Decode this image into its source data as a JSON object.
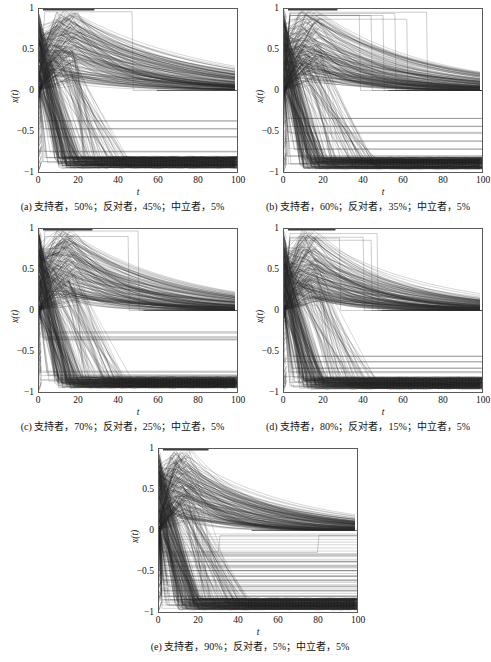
{
  "figure": {
    "background": "#ffffff",
    "line_color": "#2b2b2b",
    "frame_color": "#5a5a5a"
  },
  "axis": {
    "xlabel": "t",
    "ylabel": "x(t)",
    "xticks": [
      "0",
      "20",
      "40",
      "60",
      "80",
      "100"
    ],
    "xtick_values": [
      0,
      20,
      40,
      60,
      80,
      100
    ],
    "yticks": [
      "1",
      "0.5",
      "0",
      "−0.5",
      "−1"
    ],
    "ytick_values": [
      1,
      0.5,
      0,
      -0.5,
      -1
    ],
    "xlim": [
      0,
      100
    ],
    "ylim": [
      -1,
      1
    ],
    "grid": false
  },
  "panels": [
    {
      "id": "a",
      "caption": "(a) 支持者，50%；反对者，45%；中立者，5%",
      "supporters_pct": 50,
      "opponents_pct": 45,
      "neutral_pct": 5
    },
    {
      "id": "b",
      "caption": "(b) 支持者，60%；反对者，35%；中立者，5%",
      "supporters_pct": 60,
      "opponents_pct": 35,
      "neutral_pct": 5
    },
    {
      "id": "c",
      "caption": "(c) 支持者，70%；反对者，25%；中立者，5%",
      "supporters_pct": 70,
      "opponents_pct": 25,
      "neutral_pct": 5
    },
    {
      "id": "d",
      "caption": "(d) 支持者，80%；反对者，15%；中立者，5%",
      "supporters_pct": 80,
      "opponents_pct": 15,
      "neutral_pct": 5
    },
    {
      "id": "e",
      "caption": "(e) 支持者，90%；反对者，5%；中立者，5%",
      "supporters_pct": 90,
      "opponents_pct": 5,
      "neutral_pct": 5
    }
  ],
  "chart_data": {
    "type": "line",
    "title": "",
    "xlabel": "t",
    "ylabel": "x(t)",
    "xlim": [
      0,
      100
    ],
    "ylim": [
      -1,
      1
    ],
    "grid": false,
    "legend_position": "none",
    "note": "Each panel plots many agent opinion trajectories x(t) vs time t; values bounded in [-1,1].",
    "panels": [
      {
        "id": "a",
        "caption": "(a) 支持者，50%；反对者，45%；中立者，5%",
        "series_summary": {
          "upper_bundle_peak_value": 0.98,
          "upper_bundle_peak_time": 14,
          "upper_bundle_decay_to_zero_time": 70,
          "lower_bundle_floor_value": -0.95,
          "flat_plateau_levels": [
            -0.38,
            -0.47,
            -0.57,
            -0.75,
            -0.82,
            -0.88
          ],
          "vertical_jump_times": [
            47
          ],
          "converged_level": 0.0
        }
      },
      {
        "id": "b",
        "caption": "(b) 支持者，60%；反对者，35%；中立者，5%",
        "series_summary": {
          "upper_bundle_peak_value": 0.98,
          "upper_bundle_peak_time": 13,
          "upper_bundle_decay_to_zero_time": 62,
          "lower_bundle_floor_value": -0.96,
          "flat_plateau_levels": [
            -0.34,
            -0.44,
            -0.52,
            -0.62,
            -0.72,
            -0.8,
            -0.9
          ],
          "vertical_jump_times": [
            38,
            44,
            50,
            56,
            62,
            72
          ],
          "converged_level": 0.0
        }
      },
      {
        "id": "c",
        "caption": "(c) 支持者，70%；反对者，25%；中立者，5%",
        "series_summary": {
          "upper_bundle_peak_value": 0.98,
          "upper_bundle_peak_time": 13,
          "upper_bundle_decay_to_zero_time": 62,
          "lower_bundle_floor_value": -0.95,
          "flat_plateau_levels": [
            -0.27,
            -0.33,
            -0.36,
            -0.75,
            -0.8,
            -0.86
          ],
          "vertical_jump_times": [
            45,
            50
          ],
          "converged_level": 0.0
        }
      },
      {
        "id": "d",
        "caption": "(d) 支持者，80%；反对者，15%；中立者，5%",
        "series_summary": {
          "upper_bundle_peak_value": 0.98,
          "upper_bundle_peak_time": 12,
          "upper_bundle_decay_to_zero_time": 58,
          "lower_bundle_floor_value": -0.96,
          "flat_plateau_levels": [
            -0.57,
            -0.63,
            -0.7,
            -0.76,
            -0.82,
            -0.88,
            -0.93
          ],
          "vertical_jump_times": [
            28,
            40,
            44,
            47
          ],
          "converged_level": 0.0
        }
      },
      {
        "id": "e",
        "caption": "(e) 支持者，90%；反对者，5%；中立者，5%",
        "series_summary": {
          "upper_bundle_peak_value": 0.99,
          "upper_bundle_peak_time": 11,
          "upper_bundle_decay_to_zero_time": 55,
          "lower_bundle_floor_value": -0.97,
          "flat_plateau_levels": [
            -0.3,
            -0.38,
            -0.44,
            -0.5,
            -0.56,
            -0.62,
            -0.68,
            -0.74,
            -0.8,
            -0.86,
            -0.92
          ],
          "vertical_jump_times": [
            30,
            80
          ],
          "converged_level": 0.0
        }
      }
    ]
  }
}
